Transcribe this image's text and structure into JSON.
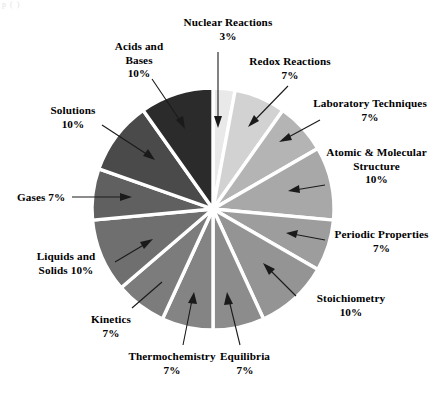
{
  "figure": {
    "corner_fragment": "p    (  )",
    "background_color": "#ffffff",
    "center_x": 213,
    "center_y": 209,
    "radius": 121,
    "separator_color": "#ffffff",
    "separator_width": 3.4
  },
  "chart_data": {
    "type": "pie",
    "title": "",
    "xlabel": "",
    "ylabel": "",
    "legend_position": "none",
    "grid": false,
    "start_angle_deg": -90,
    "direction": "clockwise",
    "units": "percent",
    "categories": [
      "Nuclear Reactions",
      "Redox Reactions",
      "Laboratory Techniques",
      "Atomic & Molecular Structure",
      "Periodic Properties",
      "Stoichiometry",
      "Equilibria",
      "Thermochemistry",
      "Kinetics",
      "Liquids and Solids",
      "Gases",
      "Solutions",
      "Acids and Bases"
    ],
    "values": [
      3,
      7,
      7,
      10,
      7,
      10,
      7,
      7,
      7,
      10,
      7,
      10,
      10
    ],
    "colors": [
      "#e9e9e9",
      "#d2d2d2",
      "#b4b4b4",
      "#a8a8a8",
      "#9d9d9d",
      "#949494",
      "#8c8c8c",
      "#848484",
      "#7c7c7c",
      "#6f6f6f",
      "#606060",
      "#4a4a4a",
      "#2b2b2b"
    ],
    "slices": [
      {
        "name": "Nuclear Reactions",
        "value": 3,
        "color": "#e9e9e9"
      },
      {
        "name": "Redox Reactions",
        "value": 7,
        "color": "#d2d2d2"
      },
      {
        "name": "Laboratory Techniques",
        "value": 7,
        "color": "#b4b4b4"
      },
      {
        "name": "Atomic & Molecular Structure",
        "value": 10,
        "color": "#a8a8a8"
      },
      {
        "name": "Periodic Properties",
        "value": 7,
        "color": "#9d9d9d"
      },
      {
        "name": "Stoichiometry",
        "value": 10,
        "color": "#949494"
      },
      {
        "name": "Equilibria",
        "value": 7,
        "color": "#8c8c8c"
      },
      {
        "name": "Thermochemistry",
        "value": 7,
        "color": "#848484"
      },
      {
        "name": "Kinetics",
        "value": 7,
        "color": "#7c7c7c"
      },
      {
        "name": "Liquids and Solids",
        "value": 10,
        "color": "#6f6f6f"
      },
      {
        "name": "Gases",
        "value": 7,
        "color": "#606060"
      },
      {
        "name": "Solutions",
        "value": 10,
        "color": "#4a4a4a"
      },
      {
        "name": "Acids and Bases",
        "value": 10,
        "color": "#2b2b2b"
      }
    ]
  },
  "labels": {
    "nuclear_reactions": {
      "line1": "Nuclear Reactions",
      "line2": "3%"
    },
    "redox_reactions": {
      "line1": "Redox Reactions",
      "line2": "7%"
    },
    "laboratory": {
      "line1": "Laboratory Techniques",
      "line2": "7%"
    },
    "atomic_molecular": {
      "line1": "Atomic & Molecular",
      "line2": "Structure",
      "line3": "10%"
    },
    "periodic_properties": {
      "line1": "Periodic Properties",
      "line2": "7%"
    },
    "stoichiometry": {
      "line1": "Stoichiometry",
      "line2": "10%"
    },
    "equilibria": {
      "line1": "Equilibria",
      "line2": "7%"
    },
    "thermochemistry": {
      "line1": "Thermochemistry",
      "line2": "7%"
    },
    "kinetics": {
      "line1": "Kinetics",
      "line2": "7%"
    },
    "liquids_solids": {
      "line1": "Liquids and",
      "line2": "Solids 10%"
    },
    "gases": {
      "line1": "Gases 7%"
    },
    "solutions": {
      "line1": "Solutions",
      "line2": "10%"
    },
    "acids_bases": {
      "line1": "Acids and",
      "line2": "Bases",
      "line3": "10%"
    }
  }
}
